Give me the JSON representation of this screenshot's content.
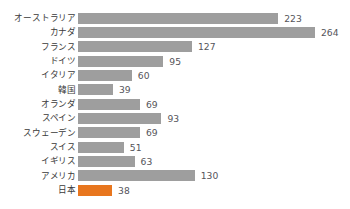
{
  "chart_data": {
    "type": "bar",
    "orientation": "horizontal",
    "title": "",
    "subtitle": "",
    "xlabel": "",
    "ylabel": "",
    "grid": false,
    "legend": null,
    "xlim": [
      0,
      264
    ],
    "categories": [
      "オーストラリア",
      "カナダ",
      "フランス",
      "ドイツ",
      "イタリア",
      "韓国",
      "オランダ",
      "スペイン",
      "スウェーデン",
      "スイス",
      "イギリス",
      "アメリカ",
      "日本"
    ],
    "values": [
      223,
      264,
      127,
      95,
      60,
      39,
      69,
      93,
      69,
      51,
      63,
      130,
      38
    ],
    "value_labels": [
      "223",
      "264",
      "127",
      "95",
      "60",
      "39",
      "69",
      "93",
      "69",
      "51",
      "63",
      "130",
      "38"
    ],
    "highlight_index": 12,
    "bar_color": "#9e9e9e",
    "highlight_color": "#e8761e",
    "label_color": "#3a3a3a",
    "value_label_color": "#55545a",
    "background_color": "#ffffff"
  }
}
